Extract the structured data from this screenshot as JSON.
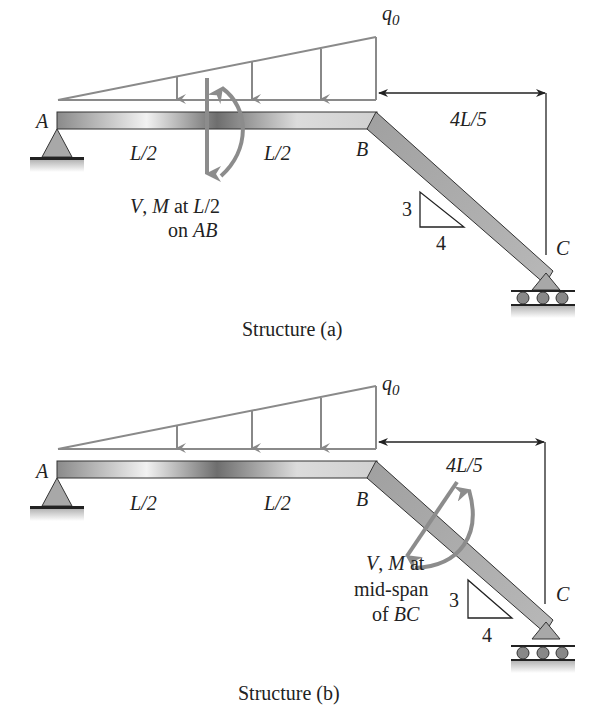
{
  "figure": {
    "structures": [
      {
        "id": "a",
        "caption": "Structure (a)",
        "labels": {
          "point_a": "A",
          "point_b": "B",
          "point_c": "C",
          "load": "q",
          "load_sub": "0",
          "span_left": "L/2",
          "span_right": "L/2",
          "horizontal_dim": "4L/5",
          "slope_rise": "3",
          "slope_run": "4",
          "section_note_line1": "V, M at L/2",
          "section_note_line2": "on AB"
        },
        "section_location": "mid-span of AB"
      },
      {
        "id": "b",
        "caption": "Structure (b)",
        "labels": {
          "point_a": "A",
          "point_b": "B",
          "point_c": "C",
          "load": "q",
          "load_sub": "0",
          "span_left": "L/2",
          "span_right": "L/2",
          "horizontal_dim": "4L/5",
          "slope_rise": "3",
          "slope_run": "4",
          "section_note_line1": "V, M at",
          "section_note_line2": "mid-span",
          "section_note_line3": "of BC"
        },
        "section_location": "mid-span of BC"
      }
    ],
    "colors": {
      "beam_dark": "#7a7a7a",
      "beam_light": "#f0f0f0",
      "load_line": "#8a8a8a",
      "arrow": "#8c8c8c",
      "support": "#a8a8a8",
      "text": "#222222"
    }
  }
}
